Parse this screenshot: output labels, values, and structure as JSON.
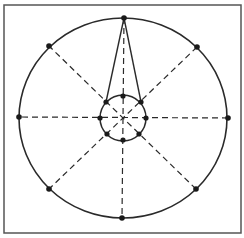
{
  "figure": {
    "colors": {
      "background": "#ffffff",
      "stroke": "#2a2a2a",
      "frame": "#555555",
      "point": "#1a1a1a"
    },
    "frame": {
      "x": 4,
      "y": 5,
      "width": 237,
      "height": 228
    },
    "outer_circle": {
      "cx": 123,
      "cy": 118,
      "rx": 104,
      "ry": 100
    },
    "inner_circle": {
      "cx": 123,
      "cy": 118,
      "r": 23
    },
    "outer_points": [
      {
        "label": "top",
        "x": 124,
        "y": 18
      },
      {
        "label": "upper-right",
        "x": 197,
        "y": 47
      },
      {
        "label": "right",
        "x": 228,
        "y": 118
      },
      {
        "label": "lower-right",
        "x": 196,
        "y": 189
      },
      {
        "label": "bottom",
        "x": 122,
        "y": 218
      },
      {
        "label": "lower-left",
        "x": 49,
        "y": 189
      },
      {
        "label": "left",
        "x": 19,
        "y": 117
      },
      {
        "label": "upper-left",
        "x": 49,
        "y": 46
      }
    ],
    "inner_points": [
      {
        "label": "inner-top",
        "x": 123,
        "y": 96
      },
      {
        "label": "inner-upper-right",
        "x": 141,
        "y": 102
      },
      {
        "label": "inner-right",
        "x": 146,
        "y": 118
      },
      {
        "label": "inner-lower-right",
        "x": 139,
        "y": 134
      },
      {
        "label": "inner-bottom",
        "x": 123,
        "y": 140
      },
      {
        "label": "inner-lower-left",
        "x": 107,
        "y": 134
      },
      {
        "label": "inner-left",
        "x": 100,
        "y": 118
      },
      {
        "label": "inner-upper-left",
        "x": 106,
        "y": 102
      }
    ],
    "triangle": {
      "apex": {
        "x": 124,
        "y": 18
      },
      "base_left": {
        "x": 106,
        "y": 102
      },
      "base_right": {
        "x": 141,
        "y": 102
      }
    }
  }
}
